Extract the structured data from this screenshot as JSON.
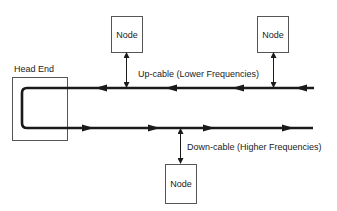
{
  "diagram": {
    "head_end": {
      "label": "Head End"
    },
    "nodes": [
      {
        "id": "node-1",
        "label": "Node"
      },
      {
        "id": "node-2",
        "label": "Node"
      },
      {
        "id": "node-3",
        "label": "Node"
      }
    ],
    "up_cable": {
      "label": "Up-cable (Lower Frequencies)",
      "direction": "right-to-left"
    },
    "down_cable": {
      "label": "Down-cable (Higher Frequencies)",
      "direction": "left-to-right"
    },
    "colors": {
      "line": "#1a1a1a",
      "box": "#555555",
      "text": "#222222"
    }
  }
}
